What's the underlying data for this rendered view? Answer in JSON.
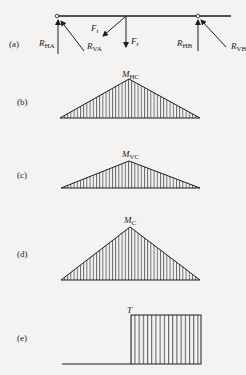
{
  "figure": {
    "panels": [
      {
        "id": "a",
        "label": "(a)",
        "description": "shaft free-body diagram"
      },
      {
        "id": "b",
        "label": "(b)",
        "peak_label": {
          "main": "M",
          "sub": "HC"
        }
      },
      {
        "id": "c",
        "label": "(c)",
        "peak_label": {
          "main": "M",
          "sub": "VC"
        }
      },
      {
        "id": "d",
        "label": "(d)",
        "peak_label": {
          "main": "M",
          "sub": "C"
        }
      },
      {
        "id": "e",
        "label": "(e)",
        "peak_label": {
          "main": "T",
          "sub": ""
        }
      }
    ],
    "forces": {
      "RHA": {
        "main": "R",
        "sub": "HA"
      },
      "RVA": {
        "main": "R",
        "sub": "VA"
      },
      "Ft": {
        "main": "F",
        "sub": "t"
      },
      "Fr": {
        "main": "F",
        "sub": "r"
      },
      "RHB": {
        "main": "R",
        "sub": "HB"
      },
      "RVB": {
        "main": "R",
        "sub": "VB"
      }
    },
    "colors": {
      "ink": "#1c1c1c",
      "background": "#f4f3f1"
    }
  }
}
